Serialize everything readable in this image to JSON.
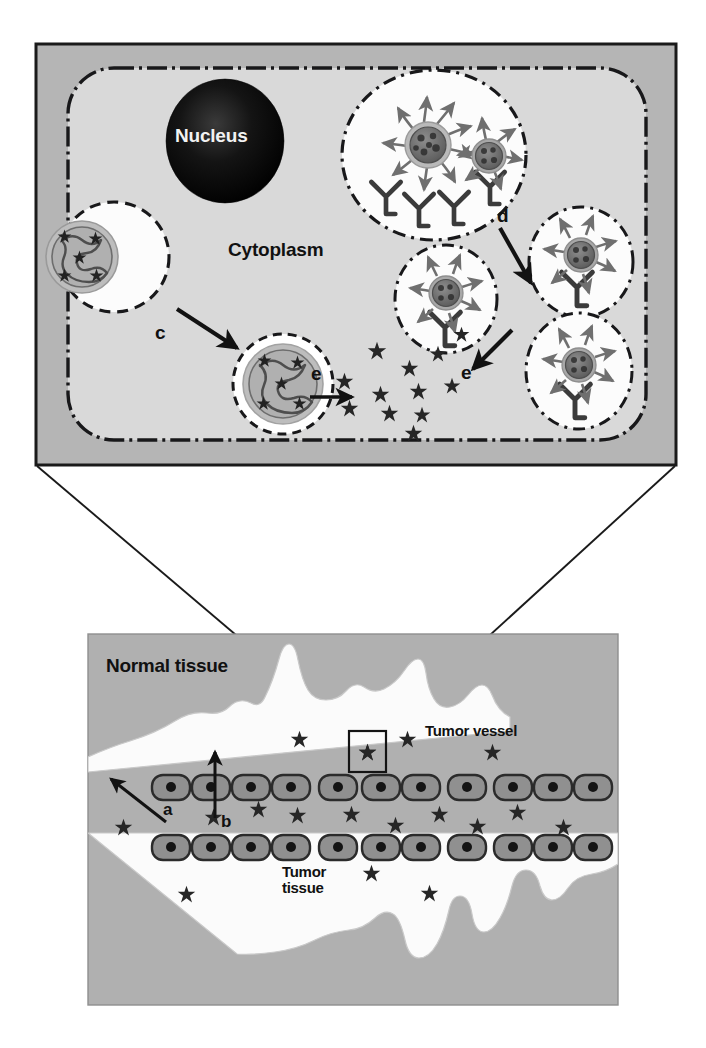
{
  "figure": {
    "panels": [
      "cell-panel",
      "tissue-panel"
    ]
  },
  "colors": {
    "panel_bg": "#b5b5b5",
    "cell_interior": "#d9d9d9",
    "vessel_lumen": "#fbfbfb",
    "endosome_fill": "#fcfcfc",
    "nucleus": "#0d0d0d",
    "endothelial_cell": "#8c8c8c",
    "endothelial_outline": "#2b2b2b",
    "drug_star": "#2a2a2a",
    "peg_arrow": "#6f6f6f",
    "frame_line": "#1a1a1a",
    "nanoparticle_shell": "#b9b9b9",
    "nanoparticle_core": "#6e6e6e"
  },
  "cell_panel": {
    "labels": {
      "nucleus": "Nucleus",
      "cytoplasm": "Cytoplasm"
    },
    "steps": [
      {
        "id": "c",
        "label": "c",
        "meaning": "endosomal escape / vesicle maturation"
      },
      {
        "id": "d",
        "label": "d",
        "meaning": "receptor-mediated internalization"
      },
      {
        "id": "e1",
        "label": "e",
        "meaning": "drug release into cytoplasm"
      },
      {
        "id": "e2",
        "label": "e",
        "meaning": "drug release into cytoplasm"
      }
    ],
    "endosomes": [
      {
        "name": "endosome-large-top",
        "particles": 2,
        "receptors": 4,
        "peg_arrows": 12
      },
      {
        "name": "endosome-right-upper",
        "particles": 1,
        "receptors": 1,
        "peg_arrows": 5
      },
      {
        "name": "endosome-middle",
        "particles": 1,
        "receptors": 1,
        "peg_arrows": 5
      },
      {
        "name": "endosome-right-lower",
        "particles": 1,
        "receptors": 1,
        "peg_arrows": 5
      }
    ],
    "vesicles": [
      {
        "name": "vesicle-left",
        "content": "nanoparticle-with-drug"
      },
      {
        "name": "vesicle-lower",
        "content": "nanoparticle-with-drug"
      }
    ],
    "released_drug_count": 12
  },
  "tissue_panel": {
    "labels": {
      "normal_tissue": "Normal tissue",
      "tumor_vessel": "Tumor vessel",
      "tumor_tissue_line1": "Tumor",
      "tumor_tissue_line2": "tissue"
    },
    "steps": [
      {
        "id": "a",
        "label": "a",
        "meaning": "clearance / extravasation into normal tissue"
      },
      {
        "id": "b",
        "label": "b",
        "meaning": "EPR-mediated accumulation in tumor"
      }
    ],
    "endothelial_cell_rows": 2,
    "endothelial_cells_per_row": 12,
    "callout_box": {
      "name": "magnified-region",
      "contains": "drug-star"
    }
  },
  "legend_glyphs": {
    "star": "drug molecule",
    "y_shape": "cell-surface receptor",
    "arrow_chain": "PEG / targeting ligand",
    "dark_disc": "nucleus"
  }
}
